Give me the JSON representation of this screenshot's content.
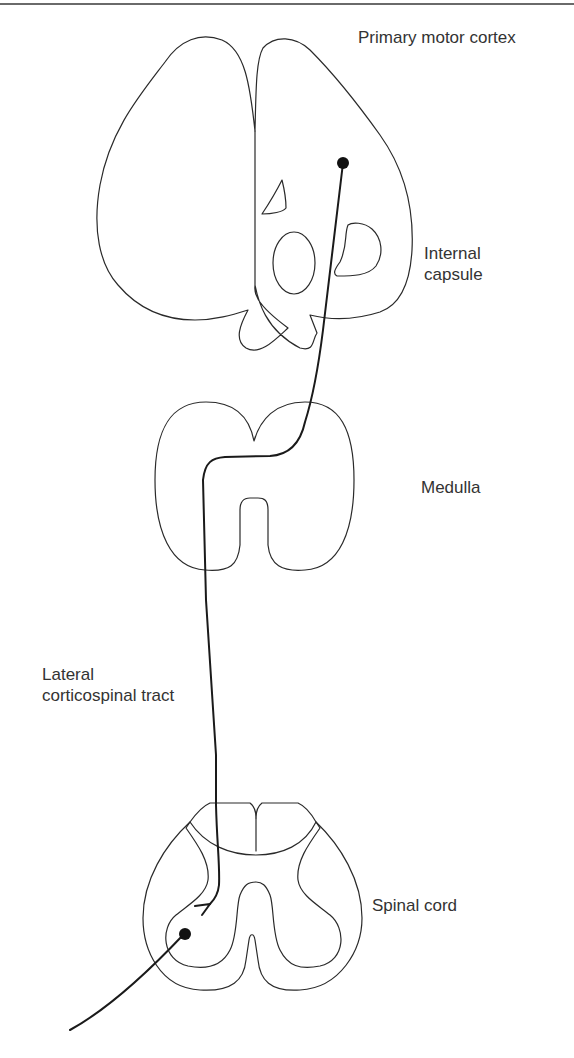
{
  "figure": {
    "type": "neuroanatomy-pathway-diagram",
    "pathway": "Lateral corticospinal tract",
    "line_color": "#2a2a2a",
    "tract_color": "#1a1a1a",
    "text_color": "#333333"
  },
  "labels": {
    "cortex": {
      "text": "Primary motor cortex"
    },
    "internal_capsule": {
      "line1": "Internal",
      "line2": "capsule"
    },
    "medulla": {
      "text": "Medulla"
    },
    "tract": {
      "line1": "Lateral",
      "line2": "corticospinal tract"
    },
    "spinal_cord": {
      "text": "Spinal cord"
    }
  },
  "structures": [
    {
      "name": "Primary motor cortex / cerebral section"
    },
    {
      "name": "Internal capsule"
    },
    {
      "name": "Medulla"
    },
    {
      "name": "Spinal cord"
    }
  ],
  "markers": [
    {
      "name": "upper-motor-neuron-cell-body",
      "location": "Primary motor cortex"
    },
    {
      "name": "lower-motor-neuron-cell-body",
      "location": "Spinal cord ventral horn"
    }
  ]
}
